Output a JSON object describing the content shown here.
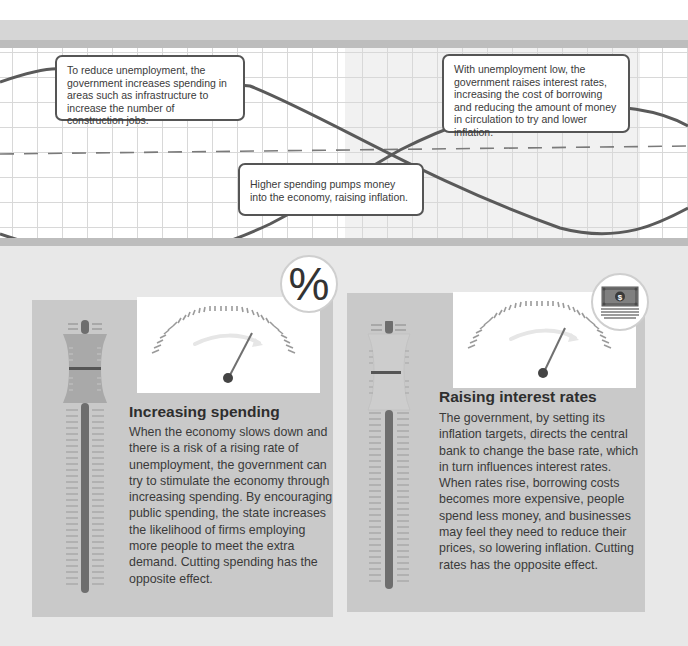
{
  "diagram": {
    "colors": {
      "background": "#ebebeb",
      "band": "#d6d6d6",
      "stripe": "#bdbdbd",
      "grid_line": "#d8d8d8",
      "curve": "#5a5a5a",
      "panel": "#c9c9c9",
      "gauge_face": "#ffffff",
      "text": "#3a3a3a"
    },
    "chart": {
      "curves": [
        "unemployment",
        "inflation"
      ],
      "has_dashed_baseline": true,
      "callouts": [
        {
          "id": "reduce-unemployment",
          "text": "To reduce unemployment, the government increases spending in areas such as infrastructure to increase the number of construction jobs."
        },
        {
          "id": "raising-inflation",
          "text": "Higher spending pumps money into the economy, raising inflation."
        },
        {
          "id": "raise-interest",
          "text": "With unemployment low, the government raises interest rates, increasing the cost of borrowing and reducing the amount of money in circulation to try and lower inflation."
        }
      ]
    },
    "panels": [
      {
        "id": "increasing-spending",
        "badge_icon": "percent-icon",
        "badge_symbol": "%",
        "title": "Increasing spending",
        "body": "When the economy slows down and there is a risk of a rising rate of unemployment, the government can try to stimulate the economy through increasing spending. By encouraging public spending, the state increases the likelihood of firms employing more people to meet the extra demand. Cutting spending has the opposite effect."
      },
      {
        "id": "raising-interest-rates",
        "badge_icon": "banknote-stack-icon",
        "badge_symbol": "$",
        "title": "Raising interest rates",
        "body": "The government, by setting its inflation targets, directs the central bank to change the base rate, which in turn influences interest rates. When rates rise, borrowing costs becomes more expensive, people spend less money, and businesses may feel they need to reduce their prices, so lowering inflation. Cutting rates has the opposite effect."
      }
    ]
  }
}
